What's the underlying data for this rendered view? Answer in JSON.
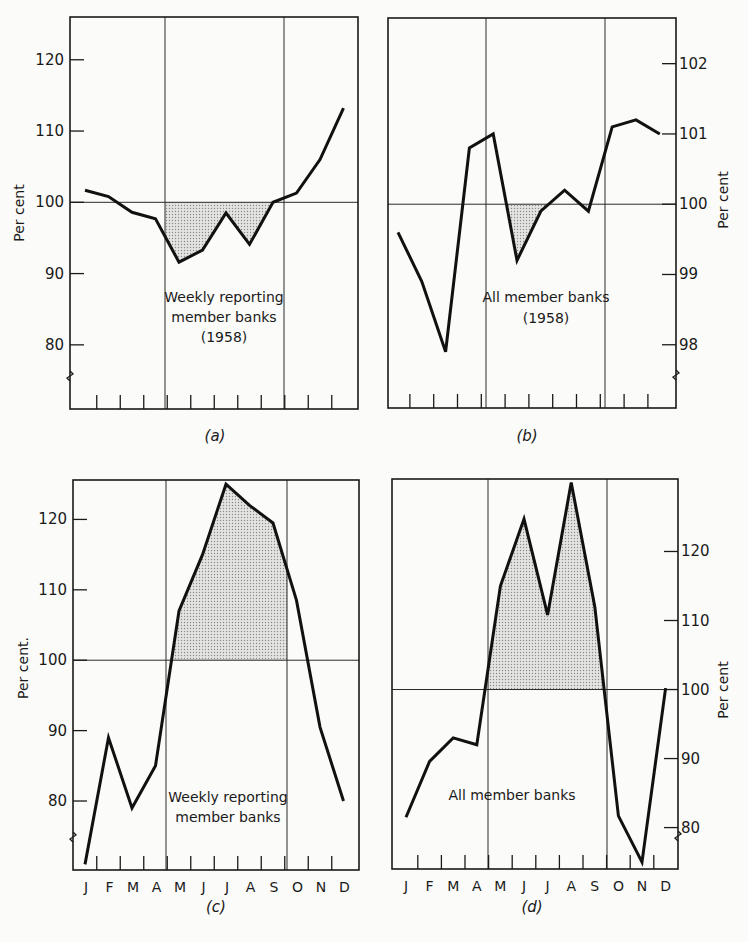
{
  "figure": {
    "months": [
      "J",
      "F",
      "M",
      "A",
      "M",
      "J",
      "J",
      "A",
      "S",
      "O",
      "N",
      "D"
    ]
  },
  "chart_data": [
    {
      "id": "a",
      "type": "line",
      "caption": "(a)",
      "title": "Weekly reporting member banks (1958)",
      "annotation_lines": [
        "Weekly reporting",
        "member banks",
        "(1958)"
      ],
      "ylabel": "Per cent",
      "ylabel_side": "left",
      "yticks": [
        80,
        90,
        100,
        110,
        120
      ],
      "ylim": [
        71,
        126
      ],
      "axis_break": true,
      "show_month_labels": false,
      "reference_line": 100,
      "shaded_region": "below 100 between May and September",
      "categories": [
        "J",
        "F",
        "M",
        "A",
        "M",
        "J",
        "J",
        "A",
        "S",
        "O",
        "N",
        "D"
      ],
      "values": [
        101.7,
        100.8,
        98.6,
        97.7,
        91.6,
        93.3,
        98.5,
        94.1,
        100.0,
        101.3,
        106.0,
        113.2
      ]
    },
    {
      "id": "b",
      "type": "line",
      "caption": "(b)",
      "title": "All member banks (1958)",
      "annotation_lines": [
        "All member banks",
        "(1958)"
      ],
      "ylabel": "Per cent",
      "ylabel_side": "right",
      "yticks": [
        98,
        99,
        100,
        101,
        102
      ],
      "ylim": [
        97.1,
        102.65
      ],
      "axis_break": true,
      "show_month_labels": false,
      "reference_line": 100,
      "shaded_region": "below 100 between May and August",
      "categories": [
        "J",
        "F",
        "M",
        "A",
        "M",
        "J",
        "J",
        "A",
        "S",
        "O",
        "N",
        "D"
      ],
      "values": [
        99.6,
        98.9,
        97.9,
        100.8,
        101.0,
        99.2,
        99.9,
        100.2,
        99.9,
        101.1,
        101.2,
        101.0
      ]
    },
    {
      "id": "c",
      "type": "line",
      "caption": "(c)",
      "title": "Weekly reporting member banks",
      "annotation_lines": [
        "Weekly reporting",
        "member banks"
      ],
      "ylabel": "Per cent.",
      "ylabel_side": "left",
      "yticks": [
        80,
        90,
        100,
        110,
        120
      ],
      "ylim": [
        70.2,
        125.6
      ],
      "axis_break": true,
      "show_month_labels": true,
      "reference_line": 100,
      "shaded_region": "above 100 between May and September",
      "categories": [
        "J",
        "F",
        "M",
        "A",
        "M",
        "J",
        "J",
        "A",
        "S",
        "O",
        "N",
        "D"
      ],
      "values": [
        71.0,
        89.0,
        79.0,
        85.0,
        107.0,
        115.0,
        125.0,
        122.0,
        119.5,
        108.5,
        90.5,
        80.0
      ]
    },
    {
      "id": "d",
      "type": "line",
      "caption": "(d)",
      "title": "All member banks",
      "annotation_lines": [
        "All member banks"
      ],
      "ylabel": "Per cent",
      "ylabel_side": "right",
      "yticks": [
        80,
        90,
        100,
        110,
        120
      ],
      "ylim": [
        74.0,
        130.5
      ],
      "axis_break": true,
      "show_month_labels": true,
      "reference_line": 100,
      "shaded_region": "above 100 between May and September",
      "categories": [
        "J",
        "F",
        "M",
        "A",
        "M",
        "J",
        "J",
        "A",
        "S",
        "O",
        "N",
        "D"
      ],
      "values": [
        81.5,
        89.6,
        93.0,
        92.0,
        115.0,
        124.7,
        110.8,
        130.0,
        112.0,
        81.7,
        75.0,
        100.2
      ]
    }
  ]
}
